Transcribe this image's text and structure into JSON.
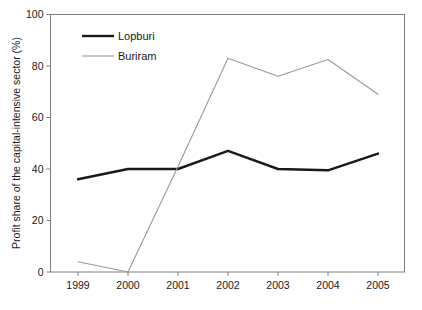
{
  "chart_data": {
    "type": "line",
    "title": "",
    "subtitle": "",
    "xlabel": "",
    "ylabel": "Profit share of the capital-intensive sector (%)",
    "categories": [
      "1999",
      "2000",
      "2001",
      "2002",
      "2003",
      "2004",
      "2005"
    ],
    "x_tick_labels": [
      "1999",
      "2000",
      "2001",
      "2002",
      "2003",
      "2004",
      "2005"
    ],
    "y_tick_labels": [
      "0",
      "20",
      "40",
      "60",
      "80",
      "100"
    ],
    "y_ticks": [
      0,
      20,
      40,
      60,
      80,
      100
    ],
    "ylim": [
      0,
      100
    ],
    "grid": false,
    "legend_position": "top-left-inside",
    "series": [
      {
        "name": "Lopburi",
        "color": "#1a1a1a",
        "line_width": 2.4,
        "values": [
          36,
          40,
          40,
          47,
          40,
          39.5,
          46
        ]
      },
      {
        "name": "Buriram",
        "color": "#9a9a9a",
        "line_width": 1.1,
        "values": [
          4,
          0,
          41,
          83,
          76,
          82.5,
          69
        ]
      }
    ]
  },
  "legend": {
    "entries": [
      {
        "label": "Lopburi"
      },
      {
        "label": "Buriram"
      }
    ]
  },
  "axes": {
    "frame_color": "#808080",
    "tick_color": "#808080"
  },
  "colors": {
    "background": "#ffffff",
    "text": "#1a1a1a",
    "series_lopburi": "#1a1a1a",
    "series_buriram": "#9a9a9a",
    "axis": "#808080"
  }
}
